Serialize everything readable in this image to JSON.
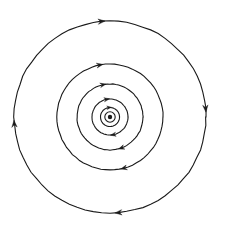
{
  "figure": {
    "type": "diagram",
    "background_color": "#ffffff",
    "stroke_color": "#1a1a1a",
    "canvas": {
      "width": 225,
      "height": 237
    },
    "center": {
      "x": 110,
      "y": 117
    },
    "flow_direction": "counterclockwise",
    "center_marker": {
      "name": "center-point",
      "dot_radius": 2.2,
      "ring_radius": 5.2,
      "stroke_width": 1.1
    },
    "rings": [
      {
        "name": "ring-1",
        "radius": 9.5,
        "stroke_width": 1.1,
        "arrows": [
          {
            "name": "arrow-ring-1-top",
            "angle_deg": 95,
            "size": 4.2
          }
        ]
      },
      {
        "name": "ring-2",
        "radius": 18,
        "stroke_width": 1.1,
        "arrows": [
          {
            "name": "arrow-ring-2-top",
            "angle_deg": 100,
            "size": 5.0
          },
          {
            "name": "arrow-ring-2-bottom",
            "angle_deg": 280,
            "size": 5.0
          }
        ]
      },
      {
        "name": "ring-3",
        "radius": 33,
        "stroke_width": 1.1,
        "arrows": [
          {
            "name": "arrow-ring-3-top",
            "angle_deg": 102,
            "size": 5.4
          },
          {
            "name": "arrow-ring-3-bottom",
            "angle_deg": 290,
            "size": 5.4
          }
        ]
      },
      {
        "name": "ring-4",
        "radius": 53,
        "stroke_width": 1.1,
        "arrows": [
          {
            "name": "arrow-ring-4-top",
            "angle_deg": 101,
            "size": 5.8
          },
          {
            "name": "arrow-ring-4-bottom",
            "angle_deg": 285,
            "size": 5.8
          }
        ]
      },
      {
        "name": "ring-5",
        "radius": 96,
        "stroke_width": 1.1,
        "arrows": [
          {
            "name": "arrow-ring-5-top",
            "angle_deg": 95,
            "size": 6.4
          },
          {
            "name": "arrow-ring-5-left",
            "angle_deg": 184,
            "size": 6.4
          },
          {
            "name": "arrow-ring-5-bottom",
            "angle_deg": 275,
            "size": 6.4
          },
          {
            "name": "arrow-ring-5-right",
            "angle_deg": 5,
            "size": 6.4
          }
        ]
      }
    ]
  }
}
